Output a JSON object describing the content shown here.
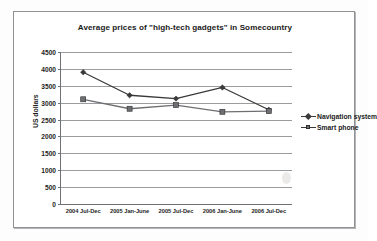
{
  "chart_data": {
    "type": "line",
    "title": "Average prices of \"high-tech gadgets\" in Somecountry",
    "xlabel": "",
    "ylabel": "US dollars",
    "categories": [
      "2004 Jul-Dec",
      "2005 Jan-June",
      "2005 Jul-Dec",
      "2006 Jan-June",
      "2006 Jul-Dec"
    ],
    "series": [
      {
        "name": "Navigation system",
        "marker": "diamond",
        "color": "#3a3a3a",
        "values": [
          3900,
          3220,
          3120,
          3450,
          2790
        ]
      },
      {
        "name": "Smart phone",
        "marker": "square",
        "color": "#6d6f72",
        "values": [
          3100,
          2820,
          2930,
          2730,
          2750
        ]
      }
    ],
    "ylim": [
      0,
      4500
    ],
    "ytick_step": 500,
    "yticks": [
      4500,
      4000,
      3500,
      3000,
      2500,
      2000,
      1500,
      1000,
      500,
      0
    ],
    "grid": true,
    "legend_position": "right"
  },
  "legend": {
    "items": [
      {
        "label": "Navigation system"
      },
      {
        "label": "Smart phone"
      }
    ]
  }
}
